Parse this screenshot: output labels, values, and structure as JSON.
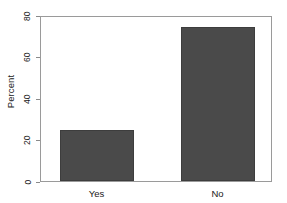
{
  "chart_data": {
    "type": "bar",
    "title": "",
    "subtitle": "",
    "xlabel": "",
    "ylabel": "Percent",
    "categories": [
      "Yes",
      "No"
    ],
    "values": [
      25,
      75
    ],
    "ylim": [
      0,
      80
    ],
    "yticks": [
      0,
      20,
      40,
      60,
      80
    ],
    "ytick_labels": [
      "0",
      "20",
      "40",
      "60",
      "80"
    ],
    "grid": false,
    "legend": null,
    "annotations": [],
    "colors": {
      "bar_fill": "#4a4a4a",
      "bar_border": "#3d3d3d",
      "frame": "#9a9a9a",
      "background": "#ffffff",
      "text": "#1a1a1a",
      "tick_mark": "#8a8a8a"
    }
  }
}
